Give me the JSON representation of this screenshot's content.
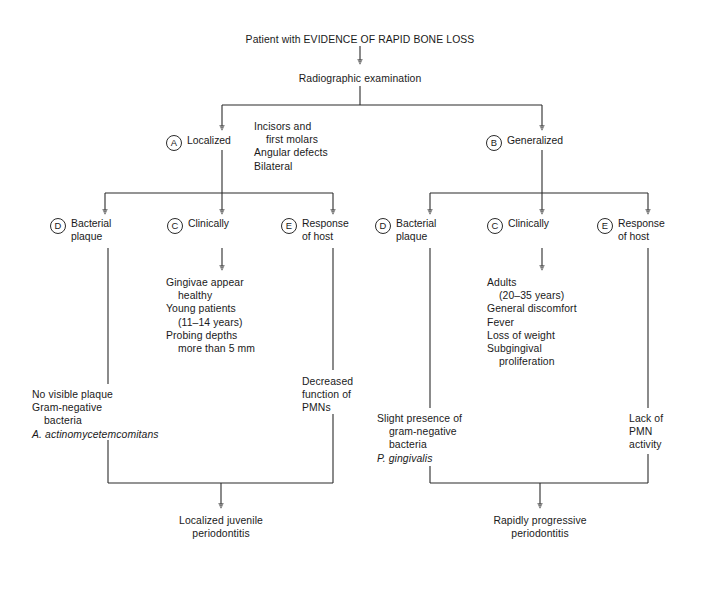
{
  "diagram": {
    "title_node": "Patient with EVIDENCE OF RAPID BONE LOSS",
    "step2": "Radiographic examination",
    "branches": {
      "localized": {
        "marker": "A",
        "label": "Localized",
        "criteria": "Incisors and\n    first molars\nAngular defects\nBilateral",
        "columns": [
          {
            "marker": "D",
            "label": "Bacterial\nplaque",
            "detail": "No visible plaque\nGram-negative\n    bacteria\nA. actinomycetemcomitans",
            "detail_italic_line": "A. actinomycetemcomitans"
          },
          {
            "marker": "C",
            "label": "Clinically",
            "detail": "Gingivae appear\n    healthy\nYoung patients\n    (11–14 years)\nProbing depths\n    more than 5 mm"
          },
          {
            "marker": "E",
            "label": "Response\nof host",
            "detail": "Decreased\nfunction of\nPMNs"
          }
        ],
        "conclusion": "Localized juvenile\nperiodontitis"
      },
      "generalized": {
        "marker": "B",
        "label": "Generalized",
        "columns": [
          {
            "marker": "D",
            "label": "Bacterial\nplaque",
            "detail": "Slight presence of\n    gram-negative\n    bacteria\nP. gingivalis",
            "detail_italic_line": "P. gingivalis"
          },
          {
            "marker": "C",
            "label": "Clinically",
            "detail": "Adults\n    (20–35 years)\nGeneral discomfort\nFever\nLoss of weight\nSubgingival\n    proliferation"
          },
          {
            "marker": "E",
            "label": "Response\nof host",
            "detail": "Lack of\nPMN\nactivity"
          }
        ],
        "conclusion": "Rapidly progressive\nperiodontitis"
      }
    },
    "colors": {
      "line": "#2b2b2b",
      "text": "#1a1a1a",
      "background": "#ffffff"
    }
  }
}
